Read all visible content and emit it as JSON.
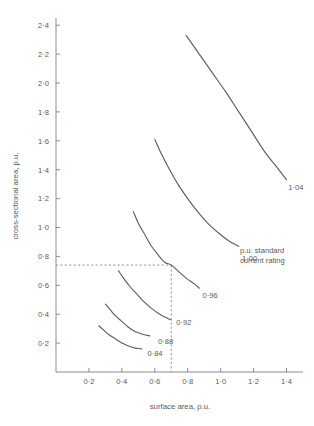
{
  "chart_data": {
    "type": "line",
    "title": "",
    "xlabel": "surface area, p.u.",
    "ylabel": "cross-sectional area, p.u.",
    "xlim": [
      0,
      1.5
    ],
    "ylim": [
      0,
      2.45
    ],
    "grid": false,
    "legend_position": "inline-curve-labels",
    "x_ticks": [
      0.2,
      0.4,
      0.6,
      0.8,
      1.0,
      1.2,
      1.4
    ],
    "x_tick_labels": [
      "0·2",
      "0·4",
      "0·6",
      "0·8",
      "1·0",
      "1·2",
      "1·4"
    ],
    "y_ticks": [
      0.2,
      0.4,
      0.6,
      0.8,
      1.0,
      1.2,
      1.4,
      1.6,
      1.8,
      2.0,
      2.2,
      2.4
    ],
    "y_tick_labels": [
      "0·2",
      "0·4",
      "0·6",
      "0·8",
      "1·0",
      "1·2",
      "1·4",
      "1·6",
      "1·8",
      "2·0",
      "2·2",
      "2·4"
    ],
    "annotation": {
      "line1": "p.u. standard",
      "line2": "current rating"
    },
    "construction_lines": {
      "horizontal_y": 0.74,
      "vertical_x": 0.7,
      "style": "dashed"
    },
    "series": [
      {
        "name": "1·04",
        "label": "1·04",
        "label_x": 1.41,
        "label_y": 1.28,
        "points": [
          [
            0.79,
            2.33
          ],
          [
            0.87,
            2.2
          ],
          [
            0.95,
            2.07
          ],
          [
            1.03,
            1.94
          ],
          [
            1.11,
            1.8
          ],
          [
            1.19,
            1.66
          ],
          [
            1.27,
            1.52
          ],
          [
            1.34,
            1.42
          ],
          [
            1.4,
            1.33
          ]
        ]
      },
      {
        "name": "1·00",
        "label": "1·00",
        "label_x": 1.13,
        "label_y": 0.79,
        "points": [
          [
            0.6,
            1.61
          ],
          [
            0.64,
            1.51
          ],
          [
            0.69,
            1.4
          ],
          [
            0.74,
            1.3
          ],
          [
            0.8,
            1.2
          ],
          [
            0.86,
            1.11
          ],
          [
            0.93,
            1.02
          ],
          [
            1.0,
            0.95
          ],
          [
            1.06,
            0.9
          ],
          [
            1.11,
            0.87
          ]
        ]
      },
      {
        "name": "0·96",
        "label": "0·96",
        "label_x": 0.89,
        "label_y": 0.53,
        "points": [
          [
            0.47,
            1.11
          ],
          [
            0.5,
            1.03
          ],
          [
            0.54,
            0.95
          ],
          [
            0.58,
            0.87
          ],
          [
            0.62,
            0.81
          ],
          [
            0.66,
            0.76
          ],
          [
            0.7,
            0.74
          ],
          [
            0.74,
            0.7
          ],
          [
            0.79,
            0.65
          ],
          [
            0.84,
            0.61
          ],
          [
            0.87,
            0.58
          ]
        ]
      },
      {
        "name": "0·92",
        "label": "0·92",
        "label_x": 0.73,
        "label_y": 0.345,
        "points": [
          [
            0.38,
            0.7
          ],
          [
            0.41,
            0.65
          ],
          [
            0.45,
            0.59
          ],
          [
            0.49,
            0.54
          ],
          [
            0.53,
            0.49
          ],
          [
            0.58,
            0.44
          ],
          [
            0.63,
            0.4
          ],
          [
            0.68,
            0.37
          ],
          [
            0.7,
            0.36
          ]
        ]
      },
      {
        "name": "0·88",
        "label": "0·88",
        "label_x": 0.62,
        "label_y": 0.215,
        "points": [
          [
            0.3,
            0.47
          ],
          [
            0.33,
            0.43
          ],
          [
            0.36,
            0.39
          ],
          [
            0.4,
            0.35
          ],
          [
            0.44,
            0.31
          ],
          [
            0.48,
            0.28
          ],
          [
            0.53,
            0.26
          ],
          [
            0.57,
            0.25
          ]
        ]
      },
      {
        "name": "0·84",
        "label": "0·84",
        "label_x": 0.555,
        "label_y": 0.13,
        "points": [
          [
            0.26,
            0.32
          ],
          [
            0.29,
            0.29
          ],
          [
            0.32,
            0.26
          ],
          [
            0.36,
            0.23
          ],
          [
            0.4,
            0.2
          ],
          [
            0.44,
            0.18
          ],
          [
            0.48,
            0.165
          ],
          [
            0.52,
            0.16
          ]
        ]
      }
    ]
  }
}
